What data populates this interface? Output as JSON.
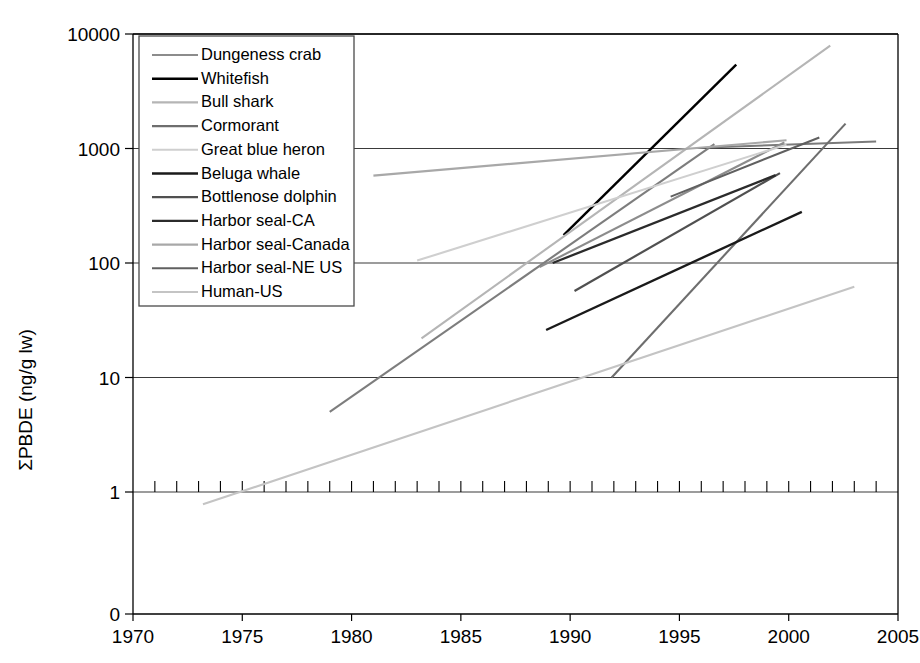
{
  "chart_data": {
    "type": "line",
    "title": "",
    "xlabel": "",
    "ylabel": "ΣPBDE (ng/g lw)",
    "xlim": [
      1970,
      2005
    ],
    "ylim_log": [
      1,
      10000
    ],
    "yscale": "log",
    "grid": true,
    "legend_position": "upper-left",
    "x_ticks": [
      "1970",
      "1975",
      "1980",
      "1985",
      "1990",
      "1995",
      "2000",
      "2005"
    ],
    "x_tick_values": [
      1970,
      1975,
      1980,
      1985,
      1990,
      1995,
      2000,
      2005
    ],
    "y_ticks": [
      "0",
      "1",
      "10",
      "100",
      "1000",
      "10000"
    ],
    "y_tick_values": [
      0,
      1,
      10,
      100,
      1000,
      10000
    ],
    "series": [
      {
        "name": "Dungeness crab",
        "color": "#8c8c8c",
        "width": 2.1,
        "x": [
          1988.6,
          1999.8
        ],
        "y": [
          92,
          1130
        ]
      },
      {
        "name": "Whitefish",
        "color": "#000000",
        "width": 2.4,
        "x": [
          1989.7,
          1997.6
        ],
        "y": [
          175,
          5400
        ]
      },
      {
        "name": "Bull shark",
        "color": "#b5b5b5",
        "width": 2.1,
        "x": [
          1983.2,
          2001.9
        ],
        "y": [
          22,
          7900
        ]
      },
      {
        "name": "Cormorant",
        "color": "#6e6e6e",
        "width": 2.1,
        "x": [
          1991.9,
          2002.6
        ],
        "y": [
          10,
          1650
        ]
      },
      {
        "name": "Great blue heron",
        "color": "#cfcfcf",
        "width": 2.1,
        "x": [
          1983.0,
          1999.9
        ],
        "y": [
          105,
          1080
        ]
      },
      {
        "name": "Beluga whale",
        "color": "#1a1a1a",
        "width": 2.4,
        "x": [
          1988.9,
          2000.6
        ],
        "y": [
          26,
          280
        ]
      },
      {
        "name": "Bottlenose dolphin",
        "color": "#505050",
        "width": 2.2,
        "x": [
          1990.2,
          1999.6
        ],
        "y": [
          57,
          610
        ]
      },
      {
        "name": "Harbor seal-CA",
        "color": "#2b2b2b",
        "width": 2.3,
        "x": [
          1989.2,
          1999.4
        ],
        "y": [
          100,
          585
        ]
      },
      {
        "name": "Harbor seal-Canada",
        "color": "#a8a8a8",
        "width": 2.1,
        "x": [
          1981.0,
          1999.9
        ],
        "y": [
          580,
          1180
        ]
      },
      {
        "name": "Harbor seal-NE US",
        "color": "#606060",
        "width": 2.1,
        "x": [
          1994.6,
          2001.4
        ],
        "y": [
          380,
          1250
        ]
      },
      {
        "name": "Human-US",
        "color": "#c4c4c4",
        "width": 2.1,
        "x": [
          1973.2,
          2003.0
        ],
        "y": [
          0.78,
          62
        ]
      }
    ],
    "extra_segments": [
      {
        "name": "Dungeness crab-lower",
        "color": "#7d7d7d",
        "width": 2.1,
        "x": [
          1979.0,
          1996.6
        ],
        "y": [
          5,
          1090
        ]
      },
      {
        "name": "Cormorant-upper",
        "color": "#7a7a7a",
        "width": 2.0,
        "x": [
          1996.3,
          2004.0
        ],
        "y": [
          1020,
          1150
        ]
      }
    ]
  },
  "legend": {
    "items": [
      {
        "label": "Dungeness crab",
        "color": "#8c8c8c",
        "width": 2.1
      },
      {
        "label": "Whitefish",
        "color": "#000000",
        "width": 2.6
      },
      {
        "label": "Bull shark",
        "color": "#b5b5b5",
        "width": 2.1
      },
      {
        "label": "Cormorant",
        "color": "#6e6e6e",
        "width": 2.1
      },
      {
        "label": "Great blue heron",
        "color": "#cfcfcf",
        "width": 2.1
      },
      {
        "label": "Beluga whale",
        "color": "#1a1a1a",
        "width": 2.6
      },
      {
        "label": "Bottlenose dolphin",
        "color": "#505050",
        "width": 2.2
      },
      {
        "label": "Harbor seal-CA",
        "color": "#2b2b2b",
        "width": 2.4
      },
      {
        "label": "Harbor seal-Canada",
        "color": "#a8a8a8",
        "width": 2.1
      },
      {
        "label": "Harbor seal-NE US",
        "color": "#606060",
        "width": 2.1
      },
      {
        "label": "Human-US",
        "color": "#c4c4c4",
        "width": 2.1
      }
    ]
  }
}
